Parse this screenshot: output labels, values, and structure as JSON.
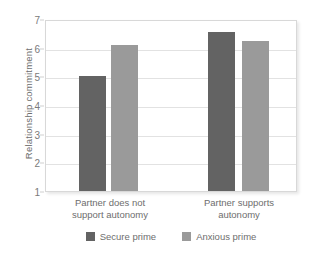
{
  "chart_data": {
    "type": "bar",
    "title": "",
    "xlabel": "",
    "ylabel": "Relationship commitment",
    "ylim": [
      1,
      7
    ],
    "yticks": [
      1,
      2,
      3,
      4,
      5,
      6,
      7
    ],
    "grid": true,
    "legend_position": "bottom",
    "categories": [
      "Partner does not support autonomy",
      "Partner supports autonomy"
    ],
    "category_lines": [
      [
        "Partner does not",
        "support autonomy"
      ],
      [
        "Partner supports",
        "autonomy"
      ]
    ],
    "series": [
      {
        "name": "Secure prime",
        "color": "#636363",
        "values": [
          5.0,
          6.55
        ]
      },
      {
        "name": "Anxious prime",
        "color": "#9a9a9a",
        "values": [
          6.1,
          6.25
        ]
      }
    ]
  },
  "legend": {
    "items": [
      {
        "label": "Secure prime"
      },
      {
        "label": "Anxious prime"
      }
    ]
  },
  "axis": {
    "tick_labels": [
      "7",
      "6",
      "5",
      "4",
      "3",
      "2",
      "1"
    ]
  }
}
